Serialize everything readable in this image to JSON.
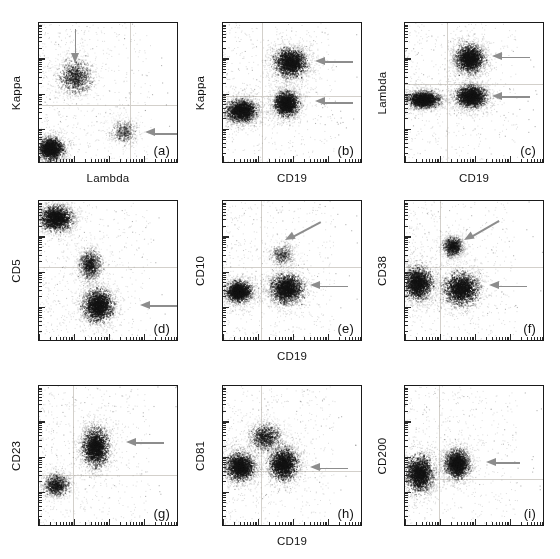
{
  "figure": {
    "type": "scatter-panel-grid",
    "rows": 3,
    "cols": 3,
    "background": "#ffffff",
    "axis_color": "#1a1a1a",
    "grid_color": "#d3d0cb",
    "arrow_color": "#8d8d8d",
    "dot_color": "#2b2b2b"
  },
  "chart_data": {
    "type": "scatter",
    "title": "",
    "subtitle": "",
    "grid": true,
    "legend_position": "none",
    "axis_scale": "log",
    "xlim": [
      0,
      100
    ],
    "ylim": [
      0,
      100
    ],
    "panels": [
      {
        "id": "a",
        "letter": "(a)",
        "xlabel": "Lambda",
        "ylabel": "Kappa",
        "quadrant_x": 65,
        "quadrant_y": 42,
        "clusters": [
          {
            "name": "kappa-positive-population",
            "cx": 26,
            "cy": 62,
            "rx": 17,
            "ry": 17,
            "density": "medium"
          },
          {
            "name": "double-negative-population",
            "cx": 8,
            "cy": 11,
            "rx": 13,
            "ry": 11,
            "density": "high"
          },
          {
            "name": "lambda-positive-population",
            "cx": 60,
            "cy": 23,
            "rx": 14,
            "ry": 12,
            "density": "low"
          }
        ],
        "arrows": [
          {
            "name": "arrow-kappa-cluster",
            "direction": "down",
            "x": 26,
            "y_start": 96,
            "y_end": 78,
            "length": 34
          },
          {
            "name": "arrow-lambda-cluster",
            "direction": "left",
            "x_tip": 76,
            "y": 22,
            "length": 40
          }
        ]
      },
      {
        "id": "b",
        "letter": "(b)",
        "xlabel": "CD19",
        "ylabel": "Kappa",
        "quadrant_x": 28,
        "quadrant_y": 48,
        "clusters": [
          {
            "name": "cd19-pos-kappa-hi-population",
            "cx": 48,
            "cy": 72,
            "rx": 16,
            "ry": 14,
            "density": "high"
          },
          {
            "name": "cd19-pos-kappa-mid-population",
            "cx": 45,
            "cy": 43,
            "rx": 12,
            "ry": 12,
            "density": "high"
          },
          {
            "name": "cd19-neg-population",
            "cx": 13,
            "cy": 38,
            "rx": 15,
            "ry": 11,
            "density": "high"
          }
        ],
        "arrows": [
          {
            "name": "arrow-kappa-hi-cluster",
            "direction": "left",
            "x_tip": 66,
            "y": 73,
            "length": 38
          },
          {
            "name": "arrow-kappa-mid-cluster",
            "direction": "left",
            "x_tip": 66,
            "y": 44,
            "length": 38
          }
        ]
      },
      {
        "id": "c",
        "letter": "(c)",
        "xlabel": "CD19",
        "ylabel": "Lambda",
        "quadrant_x": 30,
        "quadrant_y": 57,
        "clusters": [
          {
            "name": "cd19-pos-lambda-hi-population",
            "cx": 46,
            "cy": 75,
            "rx": 14,
            "ry": 14,
            "density": "high"
          },
          {
            "name": "cd19-pos-lambda-lo-population",
            "cx": 47,
            "cy": 48,
            "rx": 15,
            "ry": 11,
            "density": "high"
          },
          {
            "name": "cd19-neg-population",
            "cx": 13,
            "cy": 46,
            "rx": 16,
            "ry": 8,
            "density": "high"
          }
        ],
        "arrows": [
          {
            "name": "arrow-lambda-hi-cluster",
            "direction": "left",
            "x_tip": 62,
            "y": 76,
            "length": 38
          },
          {
            "name": "arrow-lambda-lo-cluster",
            "direction": "left",
            "x_tip": 62,
            "y": 48,
            "length": 38
          }
        ]
      },
      {
        "id": "d",
        "letter": "(d)",
        "xlabel": "",
        "ylabel": "CD5",
        "quadrant_x": 0,
        "quadrant_y": 53,
        "clusters": [
          {
            "name": "cd5-high-t-cell-population",
            "cx": 12,
            "cy": 88,
            "rx": 16,
            "ry": 12,
            "density": "high"
          },
          {
            "name": "cd5-dim-b-cell-population",
            "cx": 42,
            "cy": 26,
            "rx": 15,
            "ry": 16,
            "density": "high"
          },
          {
            "name": "cd5-intermediate-spread",
            "cx": 36,
            "cy": 55,
            "rx": 11,
            "ry": 16,
            "density": "medium"
          }
        ],
        "arrows": [
          {
            "name": "arrow-cd5-dim-cluster",
            "direction": "left",
            "x_tip": 72,
            "y": 26,
            "length": 38
          }
        ]
      },
      {
        "id": "e",
        "letter": "(e)",
        "xlabel": "CD19",
        "ylabel": "CD10",
        "quadrant_x": 27,
        "quadrant_y": 53,
        "clusters": [
          {
            "name": "cd19-pos-cd10-neg-population",
            "cx": 45,
            "cy": 38,
            "rx": 16,
            "ry": 14,
            "density": "high"
          },
          {
            "name": "cd19-neg-population",
            "cx": 11,
            "cy": 36,
            "rx": 13,
            "ry": 10,
            "density": "high"
          },
          {
            "name": "cd10-dim-tail",
            "cx": 42,
            "cy": 62,
            "rx": 12,
            "ry": 12,
            "density": "low"
          }
        ],
        "arrows": [
          {
            "name": "arrow-cd10-dim-region",
            "direction": "diagonal-down-left",
            "x_tip": 44,
            "y_tip": 72,
            "length": 40,
            "angle": -28
          },
          {
            "name": "arrow-cd19-pos-cluster",
            "direction": "left",
            "x_tip": 62,
            "y": 40,
            "length": 38
          }
        ]
      },
      {
        "id": "f",
        "letter": "(f)",
        "xlabel": "",
        "ylabel": "CD38",
        "quadrant_x": 25,
        "quadrant_y": 53,
        "clusters": [
          {
            "name": "cd38-dim-b-cell-population",
            "cx": 40,
            "cy": 38,
            "rx": 17,
            "ry": 16,
            "density": "high"
          },
          {
            "name": "cd38-negative-population",
            "cx": 9,
            "cy": 42,
            "rx": 14,
            "ry": 16,
            "density": "high"
          },
          {
            "name": "cd38-bright-population",
            "cx": 34,
            "cy": 68,
            "rx": 10,
            "ry": 10,
            "density": "medium"
          }
        ],
        "arrows": [
          {
            "name": "arrow-cd38-bright-region",
            "direction": "diagonal-down-left",
            "x_tip": 42,
            "y_tip": 72,
            "length": 40,
            "angle": -30
          },
          {
            "name": "arrow-cd38-dim-cluster",
            "direction": "left",
            "x_tip": 60,
            "y": 40,
            "length": 38
          }
        ]
      },
      {
        "id": "g",
        "letter": "(g)",
        "xlabel": "",
        "ylabel": "CD23",
        "quadrant_x": 24,
        "quadrant_y": 37,
        "clusters": [
          {
            "name": "cd23-positive-population",
            "cx": 40,
            "cy": 57,
            "rx": 13,
            "ry": 19,
            "density": "high"
          },
          {
            "name": "cd23-negative-population",
            "cx": 12,
            "cy": 30,
            "rx": 13,
            "ry": 11,
            "density": "medium"
          }
        ],
        "arrows": [
          {
            "name": "arrow-cd23-positive-cluster",
            "direction": "left",
            "x_tip": 62,
            "y": 60,
            "length": 38
          }
        ]
      },
      {
        "id": "h",
        "letter": "(h)",
        "xlabel": "CD19",
        "ylabel": "CD81",
        "quadrant_x": 27,
        "quadrant_y": 40,
        "clusters": [
          {
            "name": "cd19-pos-cd81-population",
            "cx": 43,
            "cy": 45,
            "rx": 14,
            "ry": 16,
            "density": "high"
          },
          {
            "name": "cd19-neg-population",
            "cx": 12,
            "cy": 43,
            "rx": 14,
            "ry": 14,
            "density": "high"
          },
          {
            "name": "cd81-upper-spread",
            "cx": 30,
            "cy": 64,
            "rx": 16,
            "ry": 14,
            "density": "medium"
          }
        ],
        "arrows": [
          {
            "name": "arrow-cd81-cluster",
            "direction": "left",
            "x_tip": 62,
            "y": 42,
            "length": 38
          }
        ]
      },
      {
        "id": "i",
        "letter": "(i)",
        "xlabel": "",
        "ylabel": "CD200",
        "quadrant_x": 24,
        "quadrant_y": 34,
        "clusters": [
          {
            "name": "cd200-positive-population",
            "cx": 37,
            "cy": 45,
            "rx": 12,
            "ry": 14,
            "density": "high"
          },
          {
            "name": "cd200-negative-population",
            "cx": 10,
            "cy": 38,
            "rx": 14,
            "ry": 18,
            "density": "high"
          }
        ],
        "arrows": [
          {
            "name": "arrow-cd200-positive-cluster",
            "direction": "left",
            "x_tip": 58,
            "y": 46,
            "length": 34
          }
        ]
      }
    ]
  }
}
